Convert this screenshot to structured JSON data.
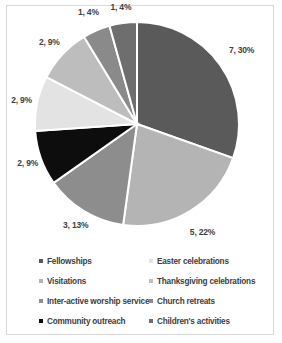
{
  "chart_data": {
    "type": "pie",
    "title": "",
    "labels": [
      "Fellowships",
      "Visitations",
      "Inter-active worship service",
      "Community outreach",
      "Easter celebrations",
      "Thanksgiving celebrations",
      "Church retreats",
      "Children's activities"
    ],
    "values": [
      7,
      5,
      3,
      2,
      2,
      2,
      1,
      1
    ],
    "percents": [
      30,
      22,
      13,
      9,
      9,
      9,
      4,
      4
    ],
    "data_labels": [
      "7, 30%",
      "5, 22%",
      "3, 13%",
      "2, 9%",
      "2, 9%",
      "2, 9%",
      "1, 4%",
      "1, 4%"
    ],
    "colors": [
      "#5a5a5a",
      "#b4b4b4",
      "#8d8d8d",
      "#0d0d0d",
      "#e3e3e3",
      "#bdbdbd",
      "#8a8a8a",
      "#6e6e6e"
    ],
    "legend_position": "bottom",
    "grid": false,
    "xlabel": "",
    "ylabel": ""
  },
  "legend": {
    "items": [
      {
        "label": "Fellowships",
        "color": "#5a5a5a"
      },
      {
        "label": "Visitations",
        "color": "#b4b4b4"
      },
      {
        "label": "Inter-active worship service",
        "color": "#8d8d8d"
      },
      {
        "label": "Community outreach",
        "color": "#0d0d0d"
      },
      {
        "label": "Easter celebrations",
        "color": "#e3e3e3"
      },
      {
        "label": "Thanksgiving celebrations",
        "color": "#bdbdbd"
      },
      {
        "label": "Church retreats",
        "color": "#8a8a8a"
      },
      {
        "label": "Children's activities",
        "color": "#6e6e6e"
      }
    ]
  },
  "style": {
    "background": "#ffffff",
    "border": "#d8d8d8",
    "slice_gap": "#ffffff",
    "text": "#3d3d3d"
  }
}
